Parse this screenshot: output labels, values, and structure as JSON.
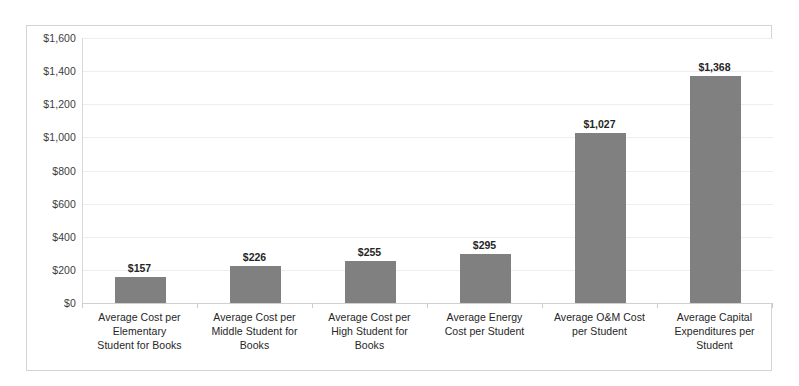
{
  "chart_data": {
    "type": "bar",
    "title": "",
    "subtitle": "",
    "xlabel": "",
    "ylabel": "",
    "ylim": [
      0,
      1600
    ],
    "ytick_step": 200,
    "grid": true,
    "legend": false,
    "legend_position": "none",
    "value_labels": true,
    "bar_color": "#808080",
    "categories": [
      "Average Cost per Elementary Student for Books",
      "Average Cost per Middle Student for Books",
      "Average Cost per High Student for Books",
      "Average Energy Cost per Student",
      "Average O&M Cost per Student",
      "Average Capital Expenditures per Student"
    ],
    "category_lines": [
      [
        "Average Cost per",
        "Elementary",
        "Student for Books"
      ],
      [
        "Average Cost per",
        "Middle Student for",
        "Books"
      ],
      [
        "Average Cost per",
        "High Student for",
        "Books"
      ],
      [
        "Average Energy",
        "Cost per Student"
      ],
      [
        "Average O&M Cost",
        "per Student"
      ],
      [
        "Average Capital",
        "Expenditures per",
        "Student"
      ]
    ],
    "values": [
      157,
      226,
      255,
      295,
      1027,
      1368
    ],
    "value_labels_text": [
      "$157",
      "$226",
      "$255",
      "$295",
      "$1,027",
      "$1,368"
    ],
    "ytick_labels": [
      "$1,600",
      "$1,400",
      "$1,200",
      "$1,000",
      "$800",
      "$600",
      "$400",
      "$200",
      "$0"
    ],
    "ytick_values": [
      1600,
      1400,
      1200,
      1000,
      800,
      600,
      400,
      200,
      0
    ]
  },
  "colors": {
    "bar": "#808080",
    "gridline": "#eeeeee",
    "axis": "#d0d0d0",
    "frame": "#d4d4d4",
    "text": "#262626",
    "tick_text": "#3d3d3d"
  }
}
